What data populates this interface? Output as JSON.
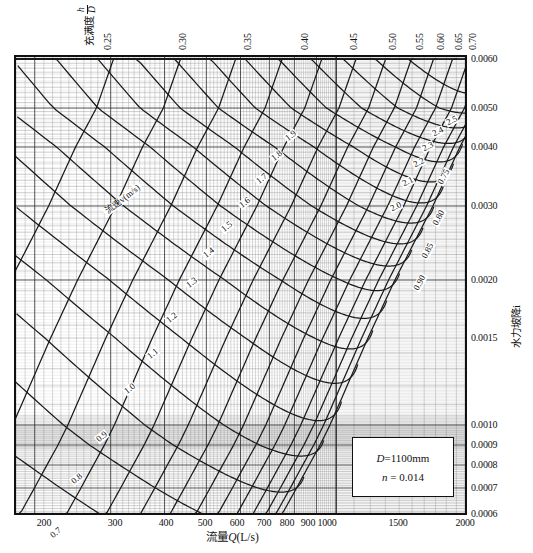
{
  "figure": {
    "type": "nomograph"
  },
  "axes": {
    "x": {
      "title_cn": "流量",
      "title_sym": "Q",
      "title_unit": "(L/s)",
      "title_full": "流量Q(L/s)",
      "scale": "log",
      "range": [
        180,
        2000
      ],
      "ticks": [
        {
          "value": 200,
          "label": "200",
          "px": 30
        },
        {
          "value": 300,
          "label": "300",
          "px": 101
        },
        {
          "value": 400,
          "label": "400",
          "px": 152
        },
        {
          "value": 500,
          "label": "500",
          "px": 191
        },
        {
          "value": 600,
          "label": "600",
          "px": 223
        },
        {
          "value": 700,
          "label": "700",
          "px": 250
        },
        {
          "value": 800,
          "label": "800",
          "px": 273
        },
        {
          "value": 900,
          "label": "900",
          "px": 294
        },
        {
          "value": 1000,
          "label": "1000",
          "px": 313
        },
        {
          "value": 1500,
          "label": "1500",
          "px": 384
        },
        {
          "value": 2000,
          "label": "2000",
          "px": 451
        }
      ]
    },
    "y_right": {
      "title_cn": "水力坡降",
      "title_sym": "i",
      "title_full": "水力坡降i",
      "scale": "log",
      "range": [
        0.0006,
        0.0062
      ],
      "ticks": [
        {
          "value": 0.006,
          "label": "0.0060",
          "px": 3
        },
        {
          "value": 0.005,
          "label": "0.0050",
          "px": 52
        },
        {
          "value": 0.004,
          "label": "0.0040",
          "px": 91
        },
        {
          "value": 0.003,
          "label": "0.0030",
          "px": 150
        },
        {
          "value": 0.002,
          "label": "0.0020",
          "px": 224
        },
        {
          "value": 0.0015,
          "label": "0.0015",
          "px": 282
        },
        {
          "value": 0.001,
          "label": "0.0010",
          "px": 369
        },
        {
          "value": 0.0009,
          "label": "0.0009",
          "px": 389
        },
        {
          "value": 0.0008,
          "label": "0.0008",
          "px": 409
        },
        {
          "value": 0.0007,
          "label": "0.0007",
          "px": 432
        },
        {
          "value": 0.0006,
          "label": "0.0006",
          "px": 458
        }
      ]
    },
    "top": {
      "title_cn": "充满度",
      "title_num": "h",
      "title_den": "D",
      "title_full": "充满度 h/D",
      "ticks": [
        {
          "value": 0.25,
          "label": "0.25",
          "px": 92
        },
        {
          "value": 0.3,
          "label": "0.30",
          "px": 167
        },
        {
          "value": 0.35,
          "label": "0.35",
          "px": 232
        },
        {
          "value": 0.4,
          "label": "0.40",
          "px": 289
        },
        {
          "value": 0.45,
          "label": "0.45",
          "px": 338
        },
        {
          "value": 0.5,
          "label": "0.50",
          "px": 377
        },
        {
          "value": 0.55,
          "label": "0.55",
          "px": 404
        },
        {
          "value": 0.6,
          "label": "0.60",
          "px": 425
        },
        {
          "value": 0.65,
          "label": "0.65",
          "px": 443
        },
        {
          "value": 0.7,
          "label": "0.70",
          "px": 457
        }
      ]
    }
  },
  "info_box": {
    "diameter_sym": "D",
    "diameter_eq": "=1100mm",
    "roughness_sym": "n",
    "roughness_eq": "= 0.014"
  },
  "velocity_family": {
    "axis_title_cn": "流速",
    "axis_title_sym": "v",
    "axis_title_unit": "(m/s)",
    "axis_title_full": "流速v(m/s)",
    "unit": "m/s",
    "labels": [
      {
        "v": 0.7,
        "label": "0.7",
        "x": 42,
        "y": 478,
        "rot": -38
      },
      {
        "v": 0.8,
        "label": "0.8",
        "x": 63,
        "y": 424,
        "rot": -38
      },
      {
        "v": 0.9,
        "label": "0.9",
        "x": 88,
        "y": 382,
        "rot": -38
      },
      {
        "v": 1.0,
        "label": "1.0",
        "x": 116,
        "y": 334,
        "rot": -38
      },
      {
        "v": 1.1,
        "label": "1.1",
        "x": 139,
        "y": 299,
        "rot": -38
      },
      {
        "v": 1.2,
        "label": "1.2",
        "x": 158,
        "y": 263,
        "rot": -38
      },
      {
        "v": 1.3,
        "label": "1.3",
        "x": 178,
        "y": 228,
        "rot": -38
      },
      {
        "v": 1.4,
        "label": "1.4",
        "x": 195,
        "y": 198,
        "rot": -38
      },
      {
        "v": 1.5,
        "label": "1.5",
        "x": 213,
        "y": 172,
        "rot": -38
      },
      {
        "v": 1.6,
        "label": "1.6",
        "x": 231,
        "y": 148,
        "rot": -38
      },
      {
        "v": 1.7,
        "label": "1.7",
        "x": 248,
        "y": 124,
        "rot": -38
      },
      {
        "v": 1.8,
        "label": "1.8",
        "x": 263,
        "y": 101,
        "rot": -38
      },
      {
        "v": 1.9,
        "label": "1.9",
        "x": 277,
        "y": 81,
        "rot": -38
      },
      {
        "v": 2.0,
        "label": "2.0",
        "x": 382,
        "y": 152,
        "rot": -26
      },
      {
        "v": 2.1,
        "label": "2.1",
        "x": 394,
        "y": 127,
        "rot": -26
      },
      {
        "v": 2.2,
        "label": "2.2",
        "x": 405,
        "y": 108,
        "rot": -26
      },
      {
        "v": 2.3,
        "label": "2.3",
        "x": 414,
        "y": 92,
        "rot": -26
      },
      {
        "v": 2.4,
        "label": "2.4",
        "x": 424,
        "y": 77,
        "rot": -26
      },
      {
        "v": 2.5,
        "label": "2.5",
        "x": 438,
        "y": 66,
        "rot": -26
      }
    ]
  },
  "fill_ratio_family": {
    "labels": [
      {
        "h": 0.75,
        "label": "0.75",
        "x": 430,
        "y": 122,
        "rot": -62
      },
      {
        "h": 0.8,
        "label": "0.80",
        "x": 425,
        "y": 163,
        "rot": -62
      },
      {
        "h": 0.85,
        "label": "0.85",
        "x": 414,
        "y": 196,
        "rot": -62
      },
      {
        "h": 0.9,
        "label": "0.90",
        "x": 406,
        "y": 228,
        "rot": -62
      }
    ]
  },
  "chart_data": {
    "type": "line",
    "title": "",
    "xlabel": "流量Q(L/s)",
    "ylabel": "水力坡降i",
    "xscale": "log",
    "yscale": "log",
    "xlim": [
      180,
      2000
    ],
    "ylim": [
      0.0006,
      0.0062
    ],
    "grid": true,
    "legend": "none",
    "annotations": [
      "D=1100mm",
      "n = 0.014"
    ],
    "series": [
      {
        "name": "流速v=0.7 m/s",
        "kind": "velocity-isoline",
        "value": 0.7,
        "unit": "m/s"
      },
      {
        "name": "流速v=0.8 m/s",
        "kind": "velocity-isoline",
        "value": 0.8,
        "unit": "m/s"
      },
      {
        "name": "流速v=0.9 m/s",
        "kind": "velocity-isoline",
        "value": 0.9,
        "unit": "m/s"
      },
      {
        "name": "流速v=1.0 m/s",
        "kind": "velocity-isoline",
        "value": 1.0,
        "unit": "m/s"
      },
      {
        "name": "流速v=1.1 m/s",
        "kind": "velocity-isoline",
        "value": 1.1,
        "unit": "m/s"
      },
      {
        "name": "流速v=1.2 m/s",
        "kind": "velocity-isoline",
        "value": 1.2,
        "unit": "m/s"
      },
      {
        "name": "流速v=1.3 m/s",
        "kind": "velocity-isoline",
        "value": 1.3,
        "unit": "m/s"
      },
      {
        "name": "流速v=1.4 m/s",
        "kind": "velocity-isoline",
        "value": 1.4,
        "unit": "m/s"
      },
      {
        "name": "流速v=1.5 m/s",
        "kind": "velocity-isoline",
        "value": 1.5,
        "unit": "m/s"
      },
      {
        "name": "流速v=1.6 m/s",
        "kind": "velocity-isoline",
        "value": 1.6,
        "unit": "m/s"
      },
      {
        "name": "流速v=1.7 m/s",
        "kind": "velocity-isoline",
        "value": 1.7,
        "unit": "m/s"
      },
      {
        "name": "流速v=1.8 m/s",
        "kind": "velocity-isoline",
        "value": 1.8,
        "unit": "m/s"
      },
      {
        "name": "流速v=1.9 m/s",
        "kind": "velocity-isoline",
        "value": 1.9,
        "unit": "m/s"
      },
      {
        "name": "流速v=2.0 m/s",
        "kind": "velocity-isoline",
        "value": 2.0,
        "unit": "m/s"
      },
      {
        "name": "流速v=2.1 m/s",
        "kind": "velocity-isoline",
        "value": 2.1,
        "unit": "m/s"
      },
      {
        "name": "流速v=2.2 m/s",
        "kind": "velocity-isoline",
        "value": 2.2,
        "unit": "m/s"
      },
      {
        "name": "流速v=2.3 m/s",
        "kind": "velocity-isoline",
        "value": 2.3,
        "unit": "m/s"
      },
      {
        "name": "流速v=2.4 m/s",
        "kind": "velocity-isoline",
        "value": 2.4,
        "unit": "m/s"
      },
      {
        "name": "流速v=2.5 m/s",
        "kind": "velocity-isoline",
        "value": 2.5,
        "unit": "m/s"
      },
      {
        "name": "充满度h/D=0.25",
        "kind": "fill-ratio-isoline",
        "value": 0.25
      },
      {
        "name": "充满度h/D=0.30",
        "kind": "fill-ratio-isoline",
        "value": 0.3
      },
      {
        "name": "充满度h/D=0.35",
        "kind": "fill-ratio-isoline",
        "value": 0.35
      },
      {
        "name": "充满度h/D=0.40",
        "kind": "fill-ratio-isoline",
        "value": 0.4
      },
      {
        "name": "充满度h/D=0.45",
        "kind": "fill-ratio-isoline",
        "value": 0.45
      },
      {
        "name": "充满度h/D=0.50",
        "kind": "fill-ratio-isoline",
        "value": 0.5
      },
      {
        "name": "充满度h/D=0.55",
        "kind": "fill-ratio-isoline",
        "value": 0.55
      },
      {
        "name": "充满度h/D=0.60",
        "kind": "fill-ratio-isoline",
        "value": 0.6
      },
      {
        "name": "充满度h/D=0.65",
        "kind": "fill-ratio-isoline",
        "value": 0.65
      },
      {
        "name": "充满度h/D=0.70",
        "kind": "fill-ratio-isoline",
        "value": 0.7
      },
      {
        "name": "充满度h/D=0.75",
        "kind": "fill-ratio-isoline",
        "value": 0.75
      },
      {
        "name": "充满度h/D=0.80",
        "kind": "fill-ratio-isoline",
        "value": 0.8
      },
      {
        "name": "充满度h/D=0.85",
        "kind": "fill-ratio-isoline",
        "value": 0.85
      },
      {
        "name": "充满度h/D=0.90",
        "kind": "fill-ratio-isoline",
        "value": 0.9
      }
    ]
  }
}
